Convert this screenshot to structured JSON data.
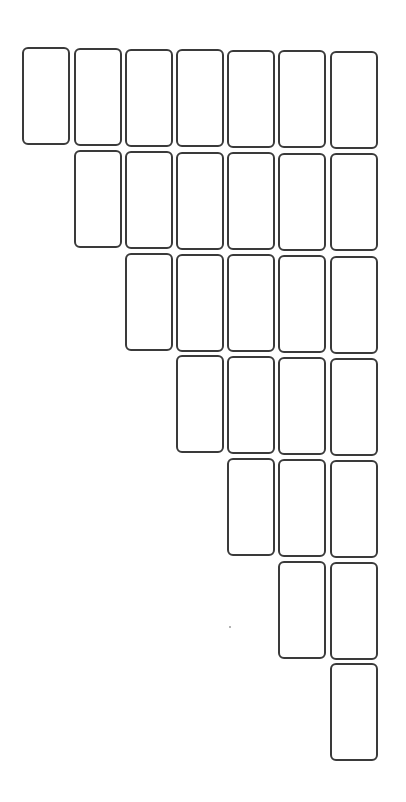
{
  "diagram": {
    "type": "triangular-card-layout",
    "card": {
      "width": 48,
      "height": 98,
      "border_color": "#3a3a3a",
      "fill": "#ffffff",
      "radius": 6
    },
    "columns": [
      {
        "index": 1,
        "left": 22,
        "tops": [
          47
        ]
      },
      {
        "index": 2,
        "left": 74,
        "tops": [
          48,
          150
        ]
      },
      {
        "index": 3,
        "left": 125,
        "tops": [
          49,
          151,
          253
        ]
      },
      {
        "index": 4,
        "left": 176,
        "tops": [
          49,
          152,
          254,
          355
        ]
      },
      {
        "index": 5,
        "left": 227,
        "tops": [
          50,
          152,
          254,
          356,
          458
        ]
      },
      {
        "index": 6,
        "left": 278,
        "tops": [
          50,
          153,
          255,
          357,
          459,
          561
        ]
      },
      {
        "index": 7,
        "left": 330,
        "tops": [
          51,
          153,
          256,
          358,
          460,
          562,
          663
        ]
      }
    ],
    "total_cards": 28,
    "speck": {
      "x": 229,
      "y": 626
    }
  }
}
